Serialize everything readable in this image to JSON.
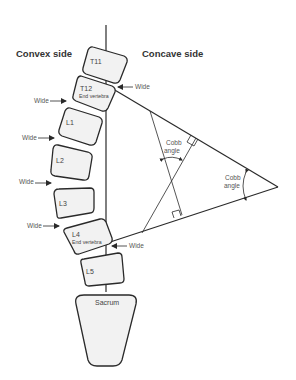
{
  "headings": {
    "convex": "Convex side",
    "concave": "Concave side"
  },
  "vertebrae": [
    {
      "id": "T11",
      "label": "T11",
      "sub": ""
    },
    {
      "id": "T12",
      "label": "T12",
      "sub": "End vertebra"
    },
    {
      "id": "L1",
      "label": "L1",
      "sub": ""
    },
    {
      "id": "L2",
      "label": "L2",
      "sub": ""
    },
    {
      "id": "L3",
      "label": "L3",
      "sub": ""
    },
    {
      "id": "L4",
      "label": "L4",
      "sub": "End vertebra"
    },
    {
      "id": "L5",
      "label": "L5",
      "sub": ""
    },
    {
      "id": "sacrum",
      "label": "Sacrum",
      "sub": ""
    }
  ],
  "wide_labels": {
    "right_top": "Wide",
    "left_1": "Wide",
    "left_2": "Wide",
    "left_3": "Wide",
    "left_4": "Wide",
    "right_bottom": "Wide"
  },
  "cobb": {
    "inner_line1": "Cobb",
    "inner_line2": "angle",
    "outer_line1": "Cobb",
    "outer_line2": "angle"
  },
  "colors": {
    "stroke": "#2a2a2a",
    "vertebra_fill": "#f2f2f2",
    "text": "#444444"
  }
}
